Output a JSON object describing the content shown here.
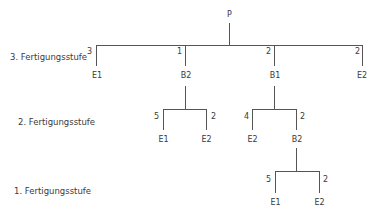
{
  "diagram": {
    "type": "bill-of-materials-tree",
    "levels": [
      {
        "label": "3. Fertigungsstufe"
      },
      {
        "label": "2. Fertigungsstufe"
      },
      {
        "label": "1. Fertigungsstufe"
      }
    ],
    "root": {
      "label": "P"
    },
    "nodes": {
      "l3_e1": {
        "label": "E1",
        "qty": "3"
      },
      "l3_b2": {
        "label": "B2",
        "qty": "1"
      },
      "l3_b1": {
        "label": "B1",
        "qty": "2"
      },
      "l3_e2": {
        "label": "E2",
        "qty": "2"
      },
      "l2_b2_e1": {
        "label": "E1",
        "qty": "5"
      },
      "l2_b2_e2": {
        "label": "E2",
        "qty": "2"
      },
      "l2_b1_e2": {
        "label": "E2",
        "qty": "4"
      },
      "l2_b1_b2": {
        "label": "B2",
        "qty": "2"
      },
      "l1_b2_e1": {
        "label": "E1",
        "qty": "5"
      },
      "l1_b2_e2": {
        "label": "E2",
        "qty": "2"
      }
    },
    "line_color": "#555555"
  }
}
